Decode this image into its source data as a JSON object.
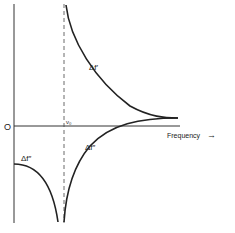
{
  "diagram": {
    "type": "dispersion curves",
    "origin_label": "O",
    "x_axis_label": "Frequency",
    "x_axis_arrow": "→",
    "resonance_label": "ν₀",
    "curves": [
      {
        "name": "upper-right",
        "label": "Δf′"
      },
      {
        "name": "lower-right",
        "label": "Δf″"
      },
      {
        "name": "lower-left",
        "label": "Δf″"
      }
    ],
    "colors": {
      "ink": "#222222",
      "background": "#ffffff"
    }
  }
}
